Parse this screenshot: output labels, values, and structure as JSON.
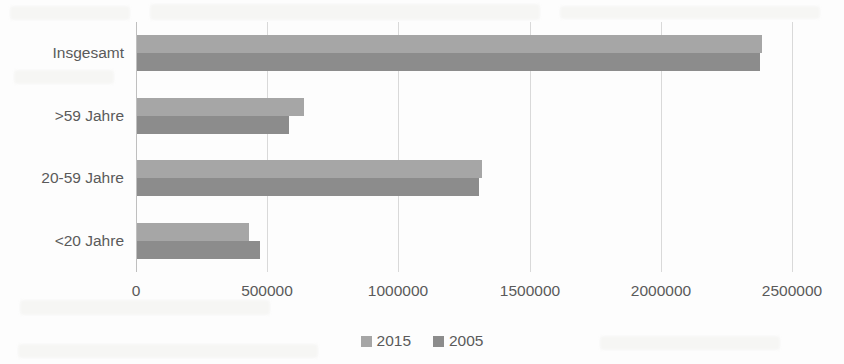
{
  "chart_data": {
    "type": "bar",
    "orientation": "horizontal",
    "title": "",
    "xlabel": "",
    "ylabel": "",
    "categories": [
      "<20 Jahre",
      "20-59 Jahre",
      ">59 Jahre",
      "Insgesamt"
    ],
    "categories_top_to_bottom": [
      "Insgesamt",
      ">59 Jahre",
      "20-59 Jahre",
      "<20 Jahre"
    ],
    "series": [
      {
        "name": "2015",
        "color": "#a6a6a6",
        "values": [
          427000,
          1315000,
          637000,
          2380000
        ]
      },
      {
        "name": "2005",
        "color": "#8c8c8c",
        "values": [
          469000,
          1303000,
          580000,
          2375000
        ]
      }
    ],
    "xlim": [
      0,
      2500000
    ],
    "xticks": [
      0,
      500000,
      1000000,
      1500000,
      2000000,
      2500000
    ],
    "xtick_labels": [
      "0",
      "500000",
      "1000000",
      "1500000",
      "2000000",
      "2500000"
    ],
    "grid": "vertical",
    "legend_position": "bottom-center"
  },
  "legend": {
    "items": [
      {
        "label": "2015",
        "color": "#a6a6a6"
      },
      {
        "label": "2005",
        "color": "#8c8c8c"
      }
    ]
  },
  "colors": {
    "series_2015": "#a6a6a6",
    "series_2005": "#8c8c8c",
    "gridline": "#d9d9d9",
    "axis": "#bfbfbf",
    "text": "#5a5a5a",
    "background": "#fdfdfd"
  }
}
